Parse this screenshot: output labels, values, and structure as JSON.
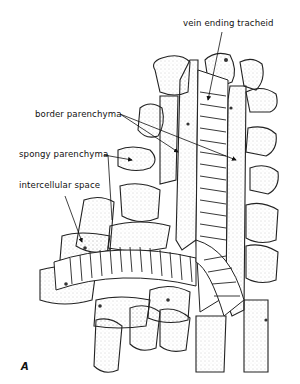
{
  "figure": {
    "panel_label": "A",
    "labels": [
      {
        "id": "vein-ending-tracheid",
        "text": "vein ending tracheid"
      },
      {
        "id": "border-parenchyma",
        "text": "border parenchyma"
      },
      {
        "id": "spongy-parenchyma",
        "text": "spongy parenchyma"
      },
      {
        "id": "intercellular-space",
        "text": "intercellular space"
      }
    ],
    "colors": {
      "ink": "#111111",
      "background": "#ffffff",
      "stipple": "#8a8a8a"
    }
  }
}
